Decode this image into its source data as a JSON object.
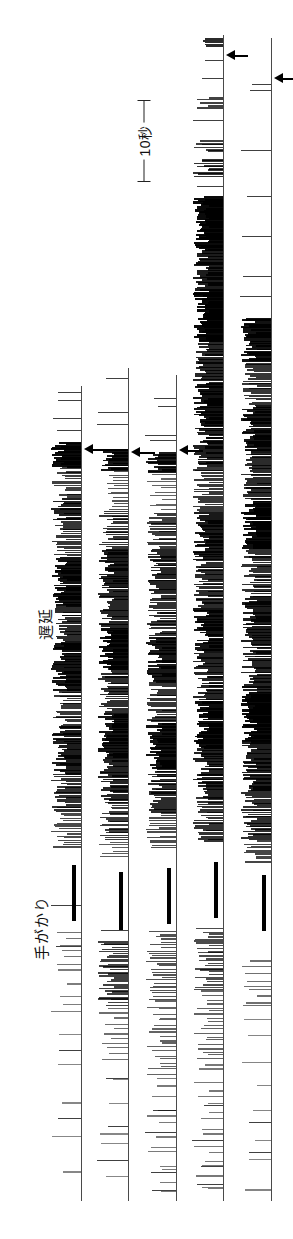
{
  "figure": {
    "width": 293,
    "height": 1239,
    "orientation": "rotated-90",
    "ink_color": "#000000",
    "baseline_color": "#4a4a4a",
    "background": "#ffffff"
  },
  "captions": [
    {
      "id": "delay",
      "text": "遅延",
      "x": 34,
      "y": 640,
      "font_size": 15
    },
    {
      "id": "cue",
      "text": "手がかり",
      "x": 30,
      "y": 960,
      "font_size": 15
    }
  ],
  "scale_bar": {
    "label": "10秒",
    "value": 10,
    "unit": "秒",
    "unit_english": "seconds",
    "x": 144,
    "y_top": 100,
    "y_bottom": 181,
    "length_px": 81
  },
  "arrows": [
    {
      "id": "arrow-track4-top",
      "x": 226,
      "y": 55,
      "length": 22,
      "direction": "left"
    },
    {
      "id": "arrow-track5-top",
      "x": 274,
      "y": 78,
      "length": 19,
      "direction": "left"
    },
    {
      "id": "arrow-track1-mid",
      "x": 84,
      "y": 449,
      "length": 24,
      "direction": "left"
    },
    {
      "id": "arrow-track2-mid",
      "x": 131,
      "y": 452,
      "length": 24,
      "direction": "left"
    },
    {
      "id": "arrow-track3-mid",
      "x": 179,
      "y": 450,
      "length": 24,
      "direction": "left"
    }
  ],
  "tracks": [
    {
      "id": "track-1",
      "baseline_x": 81,
      "baseline_top": 386,
      "baseline_bottom": 1201,
      "tick_extent": 30,
      "event_bar": {
        "y": 865,
        "height": 56,
        "width": 4,
        "offset": 9
      },
      "segments": [
        {
          "from": 442,
          "to": 466,
          "density": 0.92,
          "weight": 2.1
        },
        {
          "from": 466,
          "to": 498,
          "density": 0.55,
          "weight": 1.2
        },
        {
          "from": 498,
          "to": 520,
          "density": 0.78,
          "weight": 1.8
        },
        {
          "from": 520,
          "to": 556,
          "density": 0.62,
          "weight": 1.3
        },
        {
          "from": 556,
          "to": 604,
          "density": 0.88,
          "weight": 2.0
        },
        {
          "from": 604,
          "to": 640,
          "density": 0.7,
          "weight": 1.5
        },
        {
          "from": 640,
          "to": 690,
          "density": 0.85,
          "weight": 1.9
        },
        {
          "from": 690,
          "to": 726,
          "density": 0.6,
          "weight": 1.3
        },
        {
          "from": 726,
          "to": 772,
          "density": 0.8,
          "weight": 1.7
        },
        {
          "from": 772,
          "to": 812,
          "density": 0.66,
          "weight": 1.4
        },
        {
          "from": 812,
          "to": 848,
          "density": 0.48,
          "weight": 1.1
        },
        {
          "from": 930,
          "to": 966,
          "density": 0.18,
          "weight": 1.0
        },
        {
          "from": 966,
          "to": 1020,
          "density": 0.1,
          "weight": 1.0
        },
        {
          "from": 1020,
          "to": 1190,
          "density": 0.03,
          "weight": 1.0
        }
      ],
      "isolated_ticks": [
        392,
        400,
        418,
        430,
        905,
        946,
        1050,
        1118
      ]
    },
    {
      "id": "track-2",
      "baseline_x": 128,
      "baseline_top": 368,
      "baseline_bottom": 1201,
      "tick_extent": 30,
      "event_bar": {
        "y": 872,
        "height": 58,
        "width": 4,
        "offset": 9
      },
      "segments": [
        {
          "from": 448,
          "to": 470,
          "density": 0.85,
          "weight": 1.9
        },
        {
          "from": 470,
          "to": 510,
          "density": 0.4,
          "weight": 1.1
        },
        {
          "from": 510,
          "to": 548,
          "density": 0.62,
          "weight": 1.4
        },
        {
          "from": 548,
          "to": 588,
          "density": 0.8,
          "weight": 1.8
        },
        {
          "from": 588,
          "to": 628,
          "density": 0.72,
          "weight": 1.6
        },
        {
          "from": 628,
          "to": 668,
          "density": 0.9,
          "weight": 2.2
        },
        {
          "from": 668,
          "to": 712,
          "density": 0.68,
          "weight": 1.5
        },
        {
          "from": 712,
          "to": 758,
          "density": 0.86,
          "weight": 2.0
        },
        {
          "from": 758,
          "to": 800,
          "density": 0.74,
          "weight": 1.6
        },
        {
          "from": 800,
          "to": 840,
          "density": 0.58,
          "weight": 1.3
        },
        {
          "from": 840,
          "to": 858,
          "density": 0.35,
          "weight": 1.1
        },
        {
          "from": 940,
          "to": 1005,
          "density": 0.55,
          "weight": 1.5
        },
        {
          "from": 1005,
          "to": 1060,
          "density": 0.22,
          "weight": 1.1
        },
        {
          "from": 1060,
          "to": 1190,
          "density": 0.04,
          "weight": 1.0
        }
      ],
      "isolated_ticks": [
        378,
        412,
        424,
        930,
        1078,
        1126,
        1160
      ]
    },
    {
      "id": "track-3",
      "baseline_x": 176,
      "baseline_top": 375,
      "baseline_bottom": 1201,
      "tick_extent": 30,
      "event_bar": {
        "y": 868,
        "height": 56,
        "width": 4,
        "offset": 9
      },
      "segments": [
        {
          "from": 452,
          "to": 472,
          "density": 0.8,
          "weight": 1.9
        },
        {
          "from": 472,
          "to": 512,
          "density": 0.3,
          "weight": 1.1
        },
        {
          "from": 512,
          "to": 548,
          "density": 0.58,
          "weight": 1.4
        },
        {
          "from": 548,
          "to": 592,
          "density": 0.74,
          "weight": 1.7
        },
        {
          "from": 592,
          "to": 636,
          "density": 0.66,
          "weight": 1.5
        },
        {
          "from": 636,
          "to": 680,
          "density": 0.84,
          "weight": 2.0
        },
        {
          "from": 680,
          "to": 722,
          "density": 0.62,
          "weight": 1.4
        },
        {
          "from": 722,
          "to": 768,
          "density": 0.88,
          "weight": 2.1
        },
        {
          "from": 768,
          "to": 812,
          "density": 0.7,
          "weight": 1.6
        },
        {
          "from": 812,
          "to": 848,
          "density": 0.45,
          "weight": 1.2
        },
        {
          "from": 930,
          "to": 1000,
          "density": 0.42,
          "weight": 1.3
        },
        {
          "from": 1000,
          "to": 1075,
          "density": 0.3,
          "weight": 1.2
        },
        {
          "from": 1075,
          "to": 1195,
          "density": 0.12,
          "weight": 1.0
        }
      ],
      "isolated_ticks": [
        398,
        406,
        435,
        440,
        1110,
        1132,
        1172,
        1190
      ]
    },
    {
      "id": "track-4",
      "baseline_x": 223,
      "baseline_top": 35,
      "baseline_bottom": 1201,
      "tick_extent": 30,
      "event_bar": {
        "y": 862,
        "height": 56,
        "width": 4,
        "offset": 9
      },
      "segments": [
        {
          "from": 38,
          "to": 46,
          "density": 0.7,
          "weight": 1.5
        },
        {
          "from": 96,
          "to": 108,
          "density": 0.52,
          "weight": 1.3
        },
        {
          "from": 140,
          "to": 152,
          "density": 0.55,
          "weight": 1.4
        },
        {
          "from": 158,
          "to": 176,
          "density": 0.64,
          "weight": 1.6
        },
        {
          "from": 196,
          "to": 250,
          "density": 0.92,
          "weight": 2.3
        },
        {
          "from": 250,
          "to": 290,
          "density": 0.8,
          "weight": 2.0
        },
        {
          "from": 290,
          "to": 340,
          "density": 0.95,
          "weight": 2.4
        },
        {
          "from": 340,
          "to": 382,
          "density": 0.72,
          "weight": 1.7
        },
        {
          "from": 382,
          "to": 424,
          "density": 0.88,
          "weight": 2.1
        },
        {
          "from": 424,
          "to": 466,
          "density": 0.78,
          "weight": 1.8
        },
        {
          "from": 466,
          "to": 512,
          "density": 0.6,
          "weight": 1.4
        },
        {
          "from": 512,
          "to": 560,
          "density": 0.82,
          "weight": 1.9
        },
        {
          "from": 560,
          "to": 608,
          "density": 0.7,
          "weight": 1.6
        },
        {
          "from": 608,
          "to": 652,
          "density": 0.86,
          "weight": 2.0
        },
        {
          "from": 652,
          "to": 700,
          "density": 0.74,
          "weight": 1.7
        },
        {
          "from": 700,
          "to": 748,
          "density": 0.9,
          "weight": 2.2
        },
        {
          "from": 748,
          "to": 796,
          "density": 0.76,
          "weight": 1.8
        },
        {
          "from": 796,
          "to": 842,
          "density": 0.64,
          "weight": 1.5
        },
        {
          "from": 928,
          "to": 990,
          "density": 0.46,
          "weight": 1.3
        },
        {
          "from": 990,
          "to": 1060,
          "density": 0.3,
          "weight": 1.2
        },
        {
          "from": 1060,
          "to": 1196,
          "density": 0.14,
          "weight": 1.1
        }
      ],
      "isolated_ticks": [
        60,
        78,
        120,
        186,
        1105,
        1140,
        1166,
        1184
      ]
    },
    {
      "id": "track-5",
      "baseline_x": 271,
      "baseline_top": 38,
      "baseline_bottom": 1201,
      "tick_extent": 30,
      "event_bar": {
        "y": 875,
        "height": 56,
        "width": 4,
        "offset": 9
      },
      "segments": [
        {
          "from": 318,
          "to": 360,
          "density": 0.88,
          "weight": 2.1
        },
        {
          "from": 360,
          "to": 404,
          "density": 0.62,
          "weight": 1.5
        },
        {
          "from": 404,
          "to": 452,
          "density": 0.84,
          "weight": 2.0
        },
        {
          "from": 452,
          "to": 500,
          "density": 0.7,
          "weight": 1.6
        },
        {
          "from": 500,
          "to": 548,
          "density": 0.9,
          "weight": 2.2
        },
        {
          "from": 548,
          "to": 596,
          "density": 0.66,
          "weight": 1.5
        },
        {
          "from": 596,
          "to": 644,
          "density": 0.8,
          "weight": 1.9
        },
        {
          "from": 644,
          "to": 692,
          "density": 0.74,
          "weight": 1.7
        },
        {
          "from": 692,
          "to": 740,
          "density": 0.92,
          "weight": 2.3
        },
        {
          "from": 740,
          "to": 790,
          "density": 0.78,
          "weight": 1.8
        },
        {
          "from": 790,
          "to": 840,
          "density": 0.68,
          "weight": 1.6
        },
        {
          "from": 840,
          "to": 862,
          "density": 0.5,
          "weight": 1.3
        },
        {
          "from": 960,
          "to": 1010,
          "density": 0.2,
          "weight": 1.1
        },
        {
          "from": 1010,
          "to": 1196,
          "density": 0.05,
          "weight": 1.0
        }
      ],
      "isolated_ticks": [
        84,
        90,
        150,
        196,
        236,
        276,
        296,
        1122,
        1152
      ]
    }
  ]
}
